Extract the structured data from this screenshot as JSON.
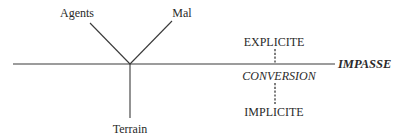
{
  "diagram": {
    "tree": {
      "top_left_label": "Agents",
      "top_right_label": "Mal",
      "bottom_label": "Terrain"
    },
    "axis": {
      "end_label": "IMPASSE"
    },
    "conversion": {
      "top_label": "EXPLICITE",
      "middle_label": "CONVERSION",
      "bottom_label": "IMPLICITE"
    }
  }
}
